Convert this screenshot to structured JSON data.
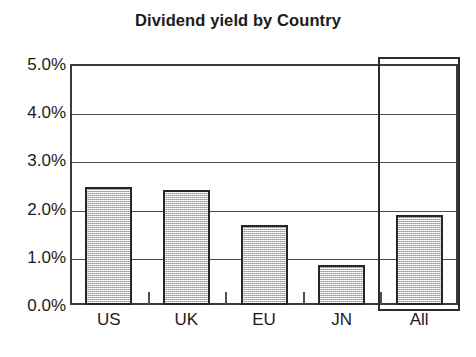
{
  "chart_data": {
    "type": "bar",
    "title": "Dividend yield by Country",
    "xlabel": "",
    "ylabel": "",
    "categories": [
      "US",
      "UK",
      "EU",
      "JN",
      "All"
    ],
    "values": [
      2.45,
      2.39,
      1.67,
      0.83,
      1.87
    ],
    "series": [
      {
        "name": "Dividend yield",
        "values": [
          2.45,
          2.39,
          1.67,
          0.83,
          1.87
        ]
      }
    ],
    "value_suffix": "%",
    "ylim": [
      0.0,
      5.0
    ],
    "ytick_values": [
      5.0,
      4.0,
      3.0,
      2.0,
      1.0,
      0.0
    ],
    "ytick_labels": [
      "5.0%",
      "4.0%",
      "3.0%",
      "2.0%",
      "1.0%",
      "0.0%"
    ],
    "grid": true,
    "grid_axis": "y",
    "legend": false,
    "legend_position": "none",
    "annotations": [
      {
        "kind": "highlight-rectangle",
        "target_category": "All",
        "note": "hand-drawn rectangle enclosing the 'All' bar and its label"
      }
    ],
    "colors": {
      "bar_fill": "#d9d9d9",
      "bar_edge": "#262626",
      "gridline": "#4a4a4a",
      "axis": "#3a3a3a",
      "text": "#1b1b1b",
      "background": "#ffffff",
      "highlight": "#2b2b2b"
    }
  }
}
